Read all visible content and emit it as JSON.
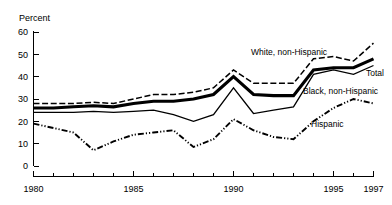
{
  "chart_data": {
    "type": "line",
    "title": "",
    "xlabel": "",
    "ylabel": "Percent",
    "ylim": [
      0,
      60
    ],
    "xlim": [
      1980,
      1997
    ],
    "grid": false,
    "legend_position": "inline-annotations",
    "ytick_labels": [
      "0",
      "10",
      "20",
      "30",
      "40",
      "50",
      "60"
    ],
    "ytick_values": [
      0,
      10,
      20,
      30,
      40,
      50,
      60
    ],
    "xtick_labels": [
      "1980",
      "1985",
      "1990",
      "1995",
      "1997"
    ],
    "xtick_values": [
      1980,
      1985,
      1990,
      1995,
      1997
    ],
    "x": [
      1980,
      1981,
      1982,
      1983,
      1984,
      1985,
      1986,
      1987,
      1988,
      1989,
      1990,
      1991,
      1992,
      1993,
      1994,
      1995,
      1996,
      1997
    ],
    "series": [
      {
        "name": "White, non-Hispanic",
        "style": "dashed",
        "label": "White, non-Hispanic",
        "values": [
          28,
          28,
          28,
          28.5,
          28,
          30,
          32,
          32,
          33,
          35,
          43,
          37,
          37,
          37,
          48,
          49,
          47,
          55
        ]
      },
      {
        "name": "Total",
        "style": "thick-solid",
        "label": "Total",
        "values": [
          26,
          26,
          26.5,
          27,
          26.5,
          28,
          29,
          29,
          30,
          32,
          40,
          32,
          31.5,
          31.5,
          43,
          44,
          44,
          48
        ]
      },
      {
        "name": "Black, non-Hispanic",
        "style": "thin-solid",
        "label": "Black, non-Hispanic",
        "values": [
          24,
          24,
          24,
          24.5,
          24,
          24.5,
          25,
          23,
          20,
          23,
          35,
          23.5,
          25,
          26.5,
          41,
          43,
          41,
          45
        ]
      },
      {
        "name": "Hispanic",
        "style": "dash-dot-dot",
        "label": "Hispanic",
        "values": [
          19,
          17,
          15,
          7,
          11,
          14,
          15,
          16,
          8.5,
          12,
          21,
          16,
          13,
          12,
          20,
          26,
          30,
          28
        ]
      }
    ]
  },
  "annotations": [
    {
      "name": "white-non-hispanic",
      "text": "White, non-Hispanic",
      "x": 251,
      "y": 55
    },
    {
      "name": "total",
      "text": "Total",
      "x": 366,
      "y": 76
    },
    {
      "name": "black-non-hispanic",
      "text": "Black, non-Hispanic",
      "x": 303,
      "y": 94
    },
    {
      "name": "hispanic",
      "text": "Hispanic",
      "x": 311,
      "y": 127
    }
  ]
}
